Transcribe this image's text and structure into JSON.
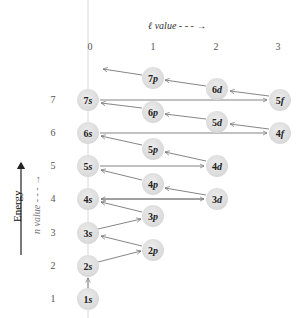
{
  "diagram": {
    "axes": {
      "l_label": "ℓ value",
      "l_arrow": "- - - →",
      "n_label": "n value",
      "n_arrow": "- - - →",
      "energy_label": "Energy",
      "l_ticks": [
        "0",
        "1",
        "2",
        "3"
      ],
      "n_ticks": [
        "1",
        "2",
        "3",
        "4",
        "5",
        "6",
        "7"
      ]
    },
    "orbitals": [
      {
        "id": "1s",
        "n": "1",
        "l": "s",
        "x": 88,
        "y": 299
      },
      {
        "id": "2s",
        "n": "2",
        "l": "s",
        "x": 88,
        "y": 266
      },
      {
        "id": "2p",
        "n": "2",
        "l": "p",
        "x": 153,
        "y": 250
      },
      {
        "id": "3s",
        "n": "3",
        "l": "s",
        "x": 88,
        "y": 233
      },
      {
        "id": "3p",
        "n": "3",
        "l": "p",
        "x": 153,
        "y": 216
      },
      {
        "id": "4s",
        "n": "4",
        "l": "s",
        "x": 88,
        "y": 199
      },
      {
        "id": "3d",
        "n": "3",
        "l": "d",
        "x": 217,
        "y": 199
      },
      {
        "id": "4p",
        "n": "4",
        "l": "p",
        "x": 153,
        "y": 184
      },
      {
        "id": "5s",
        "n": "5",
        "l": "s",
        "x": 88,
        "y": 166
      },
      {
        "id": "4d",
        "n": "4",
        "l": "d",
        "x": 217,
        "y": 166
      },
      {
        "id": "5p",
        "n": "5",
        "l": "p",
        "x": 153,
        "y": 149
      },
      {
        "id": "6s",
        "n": "6",
        "l": "s",
        "x": 88,
        "y": 133
      },
      {
        "id": "4f",
        "n": "4",
        "l": "f",
        "x": 280,
        "y": 133
      },
      {
        "id": "5d",
        "n": "5",
        "l": "d",
        "x": 217,
        "y": 122
      },
      {
        "id": "6p",
        "n": "6",
        "l": "p",
        "x": 153,
        "y": 112
      },
      {
        "id": "7s",
        "n": "7",
        "l": "s",
        "x": 88,
        "y": 100
      },
      {
        "id": "5f",
        "n": "5",
        "l": "f",
        "x": 280,
        "y": 100
      },
      {
        "id": "6d",
        "n": "6",
        "l": "d",
        "x": 217,
        "y": 89
      },
      {
        "id": "7p",
        "n": "7",
        "l": "p",
        "x": 153,
        "y": 78
      }
    ],
    "colors": {
      "circle": "#dcdcdc",
      "arrow": "#777777",
      "axis": "#cfcfcf",
      "energy_arrow": "#222222"
    }
  }
}
